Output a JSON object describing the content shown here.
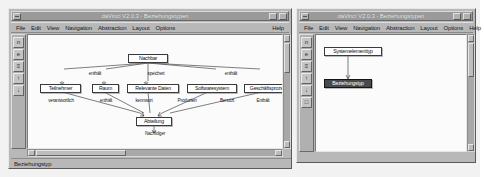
{
  "app": {
    "name": "daVinci",
    "version": "V2.0.3"
  },
  "windows": {
    "main": {
      "title": "daVinci V2.0.3 - Beziehungstypen",
      "menus": [
        {
          "label": "File",
          "accel": "F"
        },
        {
          "label": "Edit",
          "accel": "E"
        },
        {
          "label": "View",
          "accel": "V"
        },
        {
          "label": "Navigation",
          "accel": "N"
        },
        {
          "label": "Abstraction",
          "accel": "A"
        },
        {
          "label": "Layout",
          "accel": "L"
        },
        {
          "label": "Options",
          "accel": "O"
        }
      ],
      "help_menu": {
        "label": "Help",
        "accel": "H"
      },
      "title_buttons": [
        "window-menu-button",
        "minimize-button",
        "maximize-button"
      ],
      "toolbar_icons": [
        {
          "name": "new-icon",
          "glyph": "n"
        },
        {
          "name": "open-icon",
          "glyph": "e"
        },
        {
          "name": "print-icon",
          "glyph": "≡"
        },
        {
          "name": "zoom-in-icon",
          "glyph": "↑"
        },
        {
          "name": "zoom-out-icon",
          "glyph": "↓"
        }
      ],
      "statusbar": {
        "text": "Beziehungstyp"
      },
      "graph": {
        "nodes": [
          {
            "id": "nachbar",
            "label": "Nachbar",
            "x": 118,
            "y": 43,
            "w": 40
          },
          {
            "id": "teilnehmer",
            "label": "Teilnehmer",
            "x": 30,
            "y": 73,
            "w": 41
          },
          {
            "id": "raum",
            "label": "Raum",
            "x": 82,
            "y": 73,
            "w": 27
          },
          {
            "id": "relevantedaten",
            "label": "Relevante Daten",
            "x": 117,
            "y": 73,
            "w": 52
          },
          {
            "id": "softwaresystem",
            "label": "Softwaresystem",
            "x": 177,
            "y": 73,
            "w": 50
          },
          {
            "id": "geschaeftsprozess",
            "label": "Geschäftsprozess",
            "x": 234,
            "y": 73,
            "w": 50
          },
          {
            "id": "abteilung",
            "label": "Abteilung",
            "x": 126,
            "y": 106,
            "w": 36
          }
        ],
        "edge_labels": [
          {
            "id": "enthaelt-top",
            "text": "enthält",
            "x": 72,
            "y": 60
          },
          {
            "id": "speichert",
            "text": "speichert",
            "x": 132,
            "y": 60
          },
          {
            "id": "enthaelt-top2",
            "text": "enthält",
            "x": 206,
            "y": 60
          },
          {
            "id": "verantwortlich",
            "text": "verantwortlich",
            "x": 28,
            "y": 88
          },
          {
            "id": "enthaelt-bot",
            "text": "enthält",
            "x": 82,
            "y": 88
          },
          {
            "id": "kennwort",
            "text": "kennwort",
            "x": 114,
            "y": 88
          },
          {
            "id": "produziert",
            "text": "Produziert",
            "x": 156,
            "y": 88
          },
          {
            "id": "benutzt",
            "text": "Benutzt",
            "x": 199,
            "y": 88
          },
          {
            "id": "enthaelt-r",
            "text": "Enthält",
            "x": 234,
            "y": 88
          },
          {
            "id": "nachfolger",
            "text": "Nachfolger",
            "x": 126,
            "y": 120
          }
        ]
      }
    },
    "second": {
      "title": "daVinci V2.0.3 - Beziehungstypen",
      "menus": [
        {
          "label": "File",
          "accel": "F"
        },
        {
          "label": "Edit",
          "accel": "E"
        },
        {
          "label": "View",
          "accel": "V"
        },
        {
          "label": "Navigation",
          "accel": "N"
        },
        {
          "label": "Abstraction",
          "accel": "A"
        },
        {
          "label": "Layout",
          "accel": "L"
        },
        {
          "label": "Options",
          "accel": "O"
        }
      ],
      "help_menu": {
        "label": "Help",
        "accel": "H"
      },
      "title_buttons": [
        "window-menu-button",
        "minimize-button",
        "maximize-button"
      ],
      "toolbar_icons": [
        {
          "name": "new-icon",
          "glyph": "n"
        },
        {
          "name": "open-icon",
          "glyph": "e"
        },
        {
          "name": "print-icon",
          "glyph": "≡"
        },
        {
          "name": "zoom-in-icon",
          "glyph": "↑"
        },
        {
          "name": "zoom-out-icon",
          "glyph": "↓"
        },
        {
          "name": "fit-icon",
          "glyph": "□"
        }
      ],
      "graph": {
        "nodes": [
          {
            "id": "systemelementtyp",
            "label": "Systemelementtyp",
            "x": 26,
            "y": 12,
            "w": 58,
            "selected": false
          },
          {
            "id": "beziehungstyp",
            "label": "Beziehungstyp",
            "x": 14,
            "y": 44,
            "w": 48,
            "selected": true
          }
        ]
      }
    }
  },
  "colors": {
    "window_face": "#b8b8b8",
    "titlebar": "#9a9a9a",
    "canvas": "#fbfbfb",
    "node_border": "#3a3a3a",
    "node_selected": "#4a4a4a",
    "desktop": "#f2f2f2"
  }
}
